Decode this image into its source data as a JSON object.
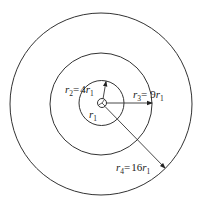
{
  "diagram": {
    "type": "concentric-circles",
    "center": {
      "label": "r1"
    },
    "circles": [
      {
        "name": "r1",
        "radius_label": "r1"
      },
      {
        "name": "r2",
        "expression": "r2= 4r1"
      },
      {
        "name": "r3",
        "expression": "r3= 9r1"
      },
      {
        "name": "r4",
        "expression": "r4= 16r1"
      }
    ],
    "labels": {
      "r1": {
        "var": "r",
        "sub": "1"
      },
      "r2": {
        "var": "r",
        "sub": "2",
        "eq": "=",
        "coef": "4",
        "var2": "r",
        "sub2": "1"
      },
      "r3": {
        "var": "r",
        "sub": "3",
        "eq": "=",
        "coef": "9",
        "var2": "r",
        "sub2": "1"
      },
      "r4": {
        "var": "r",
        "sub": "4",
        "eq": "=",
        "coef": "16",
        "var2": "r",
        "sub2": "1"
      }
    },
    "colors": {
      "stroke": "#333333",
      "text": "#222222",
      "background": "#ffffff"
    }
  }
}
